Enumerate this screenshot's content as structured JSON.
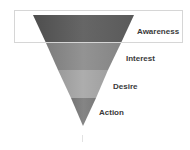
{
  "diagram": {
    "type": "funnel",
    "highlighted_stage": "Awareness",
    "stages": [
      {
        "label": "Awareness",
        "color": "#5e5e5e"
      },
      {
        "label": "Interest",
        "color": "#8a8a8a"
      },
      {
        "label": "Desire",
        "color": "#a3a3a3"
      },
      {
        "label": "Action",
        "color": "#7c7c7c"
      }
    ],
    "highlight_border_color": "#d6d6d6",
    "label_color": "#3a3a3a"
  }
}
